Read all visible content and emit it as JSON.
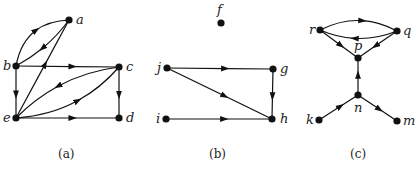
{
  "figures": [
    {
      "caption": "(a)",
      "nodes": [
        {
          "id": "a",
          "label": "a",
          "x": 69,
          "y": 20,
          "lx": 76,
          "ly": 24
        },
        {
          "id": "b",
          "label": "b",
          "x": 16,
          "y": 66,
          "lx": 3,
          "ly": 70
        },
        {
          "id": "c",
          "label": "c",
          "x": 119,
          "y": 67,
          "lx": 126,
          "ly": 71
        },
        {
          "id": "d",
          "label": "d",
          "x": 119,
          "y": 118,
          "lx": 126,
          "ly": 122
        },
        {
          "id": "e",
          "label": "e",
          "x": 16,
          "y": 118,
          "lx": 3,
          "ly": 122
        }
      ],
      "edges": [
        {
          "from": "b",
          "to": "a",
          "curve": -14
        },
        {
          "from": "a",
          "to": "b",
          "curve": -4
        },
        {
          "from": "e",
          "to": "a",
          "curve": 0
        },
        {
          "from": "b",
          "to": "c",
          "curve": 0
        },
        {
          "from": "b",
          "to": "e",
          "curve": 0
        },
        {
          "from": "c",
          "to": "e",
          "curve": 10
        },
        {
          "from": "e",
          "to": "c",
          "curve": 12
        },
        {
          "from": "c",
          "to": "d",
          "curve": 0
        },
        {
          "from": "e",
          "to": "d",
          "curve": 0
        }
      ]
    },
    {
      "caption": "(b)",
      "nodes": [
        {
          "id": "f",
          "label": "f",
          "x": 221,
          "y": 23,
          "lx": 217,
          "ly": 14
        },
        {
          "id": "g",
          "label": "g",
          "x": 273,
          "y": 69,
          "lx": 280,
          "ly": 73
        },
        {
          "id": "h",
          "label": "h",
          "x": 272,
          "y": 119,
          "lx": 280,
          "ly": 123
        },
        {
          "id": "i",
          "label": "i",
          "x": 166,
          "y": 119,
          "lx": 156,
          "ly": 123
        },
        {
          "id": "j",
          "label": "j",
          "x": 167,
          "y": 68,
          "lx": 157,
          "ly": 72
        }
      ],
      "edges": [
        {
          "from": "j",
          "to": "g",
          "curve": 0
        },
        {
          "from": "j",
          "to": "h",
          "curve": 0
        },
        {
          "from": "g",
          "to": "h",
          "curve": 0
        },
        {
          "from": "i",
          "to": "h",
          "curve": 0
        }
      ]
    },
    {
      "caption": "(c)",
      "nodes": [
        {
          "id": "r",
          "label": "r",
          "x": 320,
          "y": 30,
          "lx": 309,
          "ly": 34
        },
        {
          "id": "q",
          "label": "q",
          "x": 397,
          "y": 31,
          "lx": 403,
          "ly": 35
        },
        {
          "id": "p",
          "label": "p",
          "x": 358,
          "y": 58,
          "lx": 354,
          "ly": 50
        },
        {
          "id": "n",
          "label": "n",
          "x": 358,
          "y": 95,
          "lx": 354,
          "ly": 112
        },
        {
          "id": "k",
          "label": "k",
          "x": 319,
          "y": 120,
          "lx": 306,
          "ly": 124
        },
        {
          "id": "m",
          "label": "m",
          "x": 397,
          "y": 121,
          "lx": 403,
          "ly": 125
        }
      ],
      "edges": [
        {
          "from": "r",
          "to": "q",
          "curve": -10
        },
        {
          "from": "q",
          "to": "r",
          "curve": -8
        },
        {
          "from": "r",
          "to": "p",
          "curve": 0
        },
        {
          "from": "q",
          "to": "p",
          "curve": 0
        },
        {
          "from": "n",
          "to": "p",
          "curve": 0
        },
        {
          "from": "k",
          "to": "n",
          "curve": 0
        },
        {
          "from": "n",
          "to": "m",
          "curve": 0
        }
      ]
    }
  ],
  "captions": {
    "a": {
      "text": "(a)",
      "x": 58,
      "y": 158
    },
    "b": {
      "text": "(b)",
      "x": 209,
      "y": 158
    },
    "c": {
      "text": "(c)",
      "x": 350,
      "y": 158
    }
  }
}
